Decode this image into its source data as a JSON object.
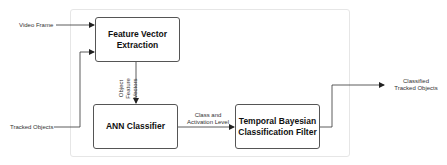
{
  "diagram": {
    "nodes": {
      "feature_extraction": {
        "line1": "Feature Vector",
        "line2": "Extraction"
      },
      "ann": {
        "label": "ANN Classifier"
      },
      "bayes": {
        "line1": "Temporal Bayesian",
        "line2": "Classification Filter"
      }
    },
    "inputs": {
      "video_frame": "Video Frame",
      "tracked_objects": "Tracked Objects"
    },
    "edges": {
      "feature_vectors_line1": "Object Feature",
      "feature_vectors_line2": "Vectors",
      "class_line1": "Class and",
      "class_line2": "Activation Level"
    },
    "outputs": {
      "line1": "Classified",
      "line2": "Tracked Objects"
    },
    "colors": {
      "stroke": "#333333",
      "container": "#e6e6e6"
    }
  }
}
